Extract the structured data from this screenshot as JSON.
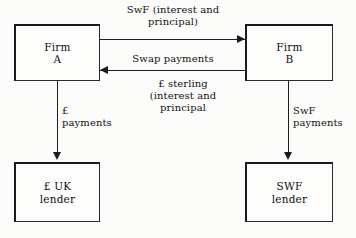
{
  "diagram": {
    "nodes": {
      "firm_a": "Firm\nA",
      "firm_b": "Firm\nB",
      "uk_lender": "£ UK\nlender",
      "swf_lender": "SWF\nlender"
    },
    "edges": {
      "swf_interest_principal": "SwF (interest and\nprincipal)",
      "swap_payments": "Swap payments",
      "sterling_interest_principal": "£ sterling\n(interest and\nprincipal",
      "gbp_payments": "£\npayments",
      "swf_payments": "SwF\npayments"
    },
    "colors": {
      "ink": "#1a1a1a",
      "paper": "#fcfcfa",
      "line": "#1d1d1d"
    }
  }
}
